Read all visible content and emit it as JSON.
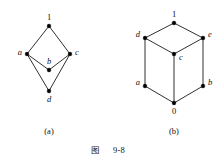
{
  "figure": {
    "caption_cjk": "图",
    "caption_number": "9-8",
    "caption_full": "图 9-8",
    "background_color": "#ffffff",
    "line_color": "#1a1a1a",
    "node_color": "#000000"
  },
  "panels": [
    {
      "id": "panel-a",
      "sublabel": "(a)",
      "sublabel_x": 49,
      "sublabel_y": 134,
      "type": "hasse-diagram",
      "nodes": [
        {
          "name": "1",
          "italic": false,
          "x": 49,
          "y": 26,
          "label_x": 49,
          "label_y": 20,
          "anchor": "middle"
        },
        {
          "name": "a",
          "italic": true,
          "x": 27,
          "y": 54,
          "label_x": 22,
          "label_y": 55,
          "anchor": "end"
        },
        {
          "name": "c",
          "italic": true,
          "x": 70,
          "y": 54,
          "label_x": 75,
          "label_y": 55,
          "anchor": "start"
        },
        {
          "name": "b",
          "italic": true,
          "x": 49,
          "y": 70,
          "label_x": 49,
          "label_y": 64,
          "anchor": "middle"
        },
        {
          "name": "d",
          "italic": true,
          "x": 49,
          "y": 91,
          "label_x": 49,
          "label_y": 102,
          "anchor": "middle"
        }
      ],
      "edges": [
        {
          "from": "1",
          "to": "a"
        },
        {
          "from": "1",
          "to": "c"
        },
        {
          "from": "a",
          "to": "b"
        },
        {
          "from": "b",
          "to": "c"
        },
        {
          "from": "a",
          "to": "d"
        },
        {
          "from": "c",
          "to": "d"
        }
      ]
    },
    {
      "id": "panel-b",
      "sublabel": "(b)",
      "sublabel_x": 174,
      "sublabel_y": 134,
      "type": "hasse-diagram",
      "nodes": [
        {
          "name": "1",
          "italic": false,
          "x": 174,
          "y": 23,
          "label_x": 174,
          "label_y": 17,
          "anchor": "middle"
        },
        {
          "name": "d",
          "italic": true,
          "x": 145,
          "y": 38,
          "label_x": 140,
          "label_y": 37,
          "anchor": "end"
        },
        {
          "name": "e",
          "italic": true,
          "x": 203,
          "y": 38,
          "label_x": 208,
          "label_y": 37,
          "anchor": "start"
        },
        {
          "name": "c",
          "italic": true,
          "x": 174,
          "y": 54,
          "label_x": 179,
          "label_y": 60,
          "anchor": "start"
        },
        {
          "name": "a",
          "italic": true,
          "x": 145,
          "y": 86,
          "label_x": 140,
          "label_y": 85,
          "anchor": "end"
        },
        {
          "name": "b",
          "italic": true,
          "x": 203,
          "y": 86,
          "label_x": 208,
          "label_y": 85,
          "anchor": "start"
        },
        {
          "name": "0",
          "italic": false,
          "x": 174,
          "y": 103,
          "label_x": 174,
          "label_y": 114,
          "anchor": "middle"
        }
      ],
      "edges": [
        {
          "from": "1",
          "to": "d"
        },
        {
          "from": "1",
          "to": "e"
        },
        {
          "from": "d",
          "to": "c"
        },
        {
          "from": "c",
          "to": "e"
        },
        {
          "from": "d",
          "to": "a"
        },
        {
          "from": "e",
          "to": "b"
        },
        {
          "from": "a",
          "to": "0"
        },
        {
          "from": "b",
          "to": "0"
        },
        {
          "from": "c",
          "to": "0"
        }
      ]
    }
  ],
  "caption_layout": {
    "cjk_x": 95,
    "num_x": 119,
    "y": 153
  }
}
